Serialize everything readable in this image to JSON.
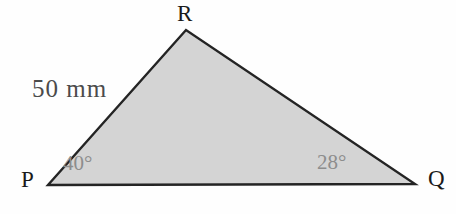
{
  "figure": {
    "type": "geometry-triangle-diagram",
    "background_color": "#fefefe",
    "triangle": {
      "name": "triangle-PQR",
      "fill_color": "#d4d4d4",
      "stroke_color": "#242424",
      "stroke_width": 2.4,
      "points": "48,185 415,184 186,30",
      "vertices": [
        {
          "id": "P",
          "label": "P",
          "x": 48,
          "y": 185
        },
        {
          "id": "Q",
          "label": "Q",
          "x": 415,
          "y": 184
        },
        {
          "id": "R",
          "label": "R",
          "x": 186,
          "y": 30
        }
      ]
    },
    "side_labels": [
      {
        "id": "PR",
        "label": "50 mm",
        "color": "#4b4b4b"
      }
    ],
    "angle_labels": [
      {
        "id": "angle-at-P",
        "label": "40°",
        "value": 40,
        "unit": "degrees",
        "color": "#8d8d8d"
      },
      {
        "id": "angle-at-Q",
        "label": "28°",
        "value": 28,
        "unit": "degrees",
        "color": "#8d8d8d"
      }
    ],
    "artifacts": {
      "bleed_top": "              ",
      "bleed_mid": "          "
    }
  }
}
